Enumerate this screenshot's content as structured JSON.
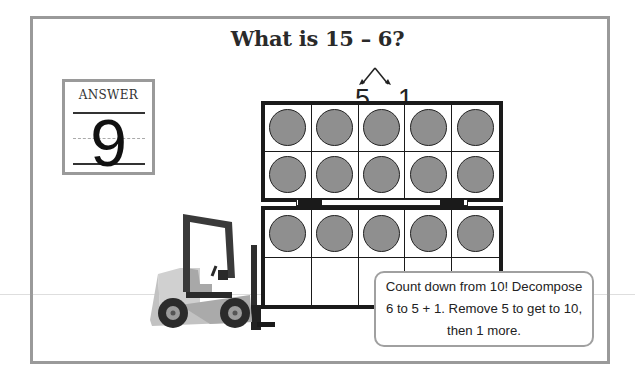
{
  "problem": {
    "title": "What is 15 – 6?",
    "decomposition": {
      "left": "5",
      "right": "1"
    }
  },
  "answer_card": {
    "label": "ANSWER",
    "value": "9"
  },
  "ten_frames": [
    {
      "name": "top-ten-frame",
      "rows": 2,
      "cols": 5,
      "filled": 10
    },
    {
      "name": "bottom-ten-frame",
      "rows": 2,
      "cols": 5,
      "filled": 5
    }
  ],
  "hint": {
    "text": "Count down from 10! Decompose 6 to 5 + 1. Remove 5 to get to 10, then 1 more."
  },
  "illustration": {
    "vehicle": "forklift-icon"
  },
  "colors": {
    "frame_border": "#9a9a9a",
    "counter_fill": "#8f8f8f",
    "grid_line": "#1a1a1a",
    "text": "#222222"
  }
}
